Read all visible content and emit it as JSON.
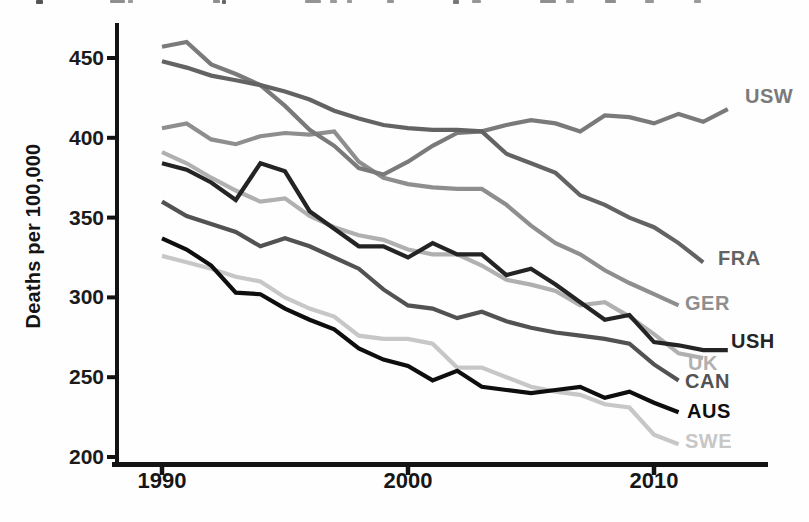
{
  "page": {
    "background": "#fefefe",
    "cropped_caption_fragments": [
      {
        "x": 36,
        "w": 7,
        "h": 4,
        "shade": "#555555"
      },
      {
        "x": 110,
        "w": 15,
        "h": 3,
        "shade": "#8f8f8f"
      },
      {
        "x": 128,
        "w": 5,
        "h": 3,
        "shade": "#9a9a9a"
      },
      {
        "x": 213,
        "w": 7,
        "h": 3,
        "shade": "#8f8f8f"
      },
      {
        "x": 222,
        "w": 4,
        "h": 4,
        "shade": "#666666"
      },
      {
        "x": 305,
        "w": 16,
        "h": 3,
        "shade": "#949494"
      },
      {
        "x": 330,
        "w": 7,
        "h": 3,
        "shade": "#9a9a9a"
      },
      {
        "x": 347,
        "w": 5,
        "h": 3,
        "shade": "#999999"
      },
      {
        "x": 387,
        "w": 7,
        "h": 3,
        "shade": "#959595"
      },
      {
        "x": 453,
        "w": 6,
        "h": 4,
        "shade": "#777777"
      },
      {
        "x": 472,
        "w": 9,
        "h": 3,
        "shade": "#979797"
      },
      {
        "x": 540,
        "w": 16,
        "h": 3,
        "shade": "#909090"
      },
      {
        "x": 566,
        "w": 8,
        "h": 3,
        "shade": "#9a9a9a"
      },
      {
        "x": 605,
        "w": 11,
        "h": 3,
        "shade": "#8f8f8f"
      },
      {
        "x": 645,
        "w": 9,
        "h": 3,
        "shade": "#979797"
      },
      {
        "x": 694,
        "w": 7,
        "h": 3,
        "shade": "#9b9b9b"
      }
    ]
  },
  "chart_data": {
    "type": "line",
    "title": "",
    "xlabel": "",
    "ylabel": "Deaths per 100,000",
    "grid": false,
    "legend_position": "direct-labels-right",
    "x_axis": {
      "tick_years": [
        1990,
        2000,
        2010
      ],
      "tick_labels": [
        "1990",
        "2000",
        "2010"
      ],
      "range_years": [
        1988.2,
        2014.6
      ]
    },
    "y_axis": {
      "tick_values": [
        450,
        400,
        350,
        300,
        250,
        200
      ],
      "tick_labels": [
        "450",
        "400",
        "350",
        "300",
        "250",
        "200"
      ],
      "range": [
        196,
        471
      ]
    },
    "series": [
      {
        "name": "USW",
        "label": "USW",
        "color": "#7a7a7a",
        "start_year": 1990,
        "end_year": 2013,
        "label_x": 745,
        "label_y": 86,
        "values": [
          457,
          460,
          446,
          440,
          433,
          420,
          405,
          395,
          381,
          377,
          385,
          395,
          403,
          404,
          408,
          411,
          409,
          404,
          414,
          413,
          409,
          415,
          410,
          418
        ]
      },
      {
        "name": "FRA",
        "label": "FRA",
        "color": "#636363",
        "start_year": 1990,
        "end_year": 2012,
        "label_x": 718,
        "label_y": 248,
        "values": [
          448,
          444,
          439,
          436,
          433,
          429,
          424,
          417,
          412,
          408,
          406,
          405,
          405,
          404,
          390,
          384,
          378,
          364,
          358,
          350,
          344,
          334,
          322
        ]
      },
      {
        "name": "GER",
        "label": "GER",
        "color": "#8e8e8e",
        "start_year": 1990,
        "end_year": 2011,
        "label_x": 685,
        "label_y": 293,
        "values": [
          406,
          409,
          399,
          396,
          401,
          403,
          402,
          404,
          385,
          375,
          371,
          369,
          368,
          368,
          358,
          345,
          334,
          327,
          317,
          309,
          302,
          295
        ]
      },
      {
        "name": "USH",
        "label": "USH",
        "color": "#242424",
        "start_year": 1990,
        "end_year": 2013,
        "label_x": 731,
        "label_y": 331,
        "values": [
          384,
          380,
          372,
          361,
          384,
          379,
          354,
          343,
          332,
          332,
          325,
          334,
          327,
          327,
          314,
          318,
          308,
          297,
          286,
          289,
          272,
          270,
          267,
          267
        ]
      },
      {
        "name": "UK",
        "label": "UK",
        "color": "#b0b0b0",
        "start_year": 1990,
        "end_year": 2012,
        "label_x": 688,
        "label_y": 353,
        "values": [
          391,
          384,
          375,
          367,
          360,
          362,
          351,
          344,
          339,
          336,
          330,
          327,
          327,
          320,
          311,
          308,
          304,
          295,
          297,
          288,
          277,
          265,
          262
        ]
      },
      {
        "name": "CAN",
        "label": "CAN",
        "color": "#525252",
        "start_year": 1990,
        "end_year": 2011,
        "label_x": 685,
        "label_y": 371,
        "values": [
          360,
          351,
          346,
          341,
          332,
          337,
          332,
          325,
          318,
          305,
          295,
          293,
          287,
          291,
          285,
          281,
          278,
          276,
          274,
          271,
          258,
          248
        ]
      },
      {
        "name": "AUS",
        "label": "AUS",
        "color": "#0e0e0e",
        "start_year": 1990,
        "end_year": 2011,
        "label_x": 687,
        "label_y": 401,
        "values": [
          337,
          330,
          320,
          303,
          302,
          293,
          286,
          280,
          268,
          261,
          257,
          248,
          254,
          244,
          242,
          240,
          242,
          244,
          237,
          241,
          234,
          228
        ]
      },
      {
        "name": "SWE",
        "label": "SWE",
        "color": "#c7c7c7",
        "start_year": 1990,
        "end_year": 2011,
        "label_x": 685,
        "label_y": 431,
        "values": [
          326,
          322,
          318,
          313,
          310,
          300,
          293,
          288,
          276,
          274,
          274,
          271,
          256,
          256,
          250,
          244,
          241,
          239,
          233,
          231,
          214,
          208
        ]
      }
    ]
  }
}
